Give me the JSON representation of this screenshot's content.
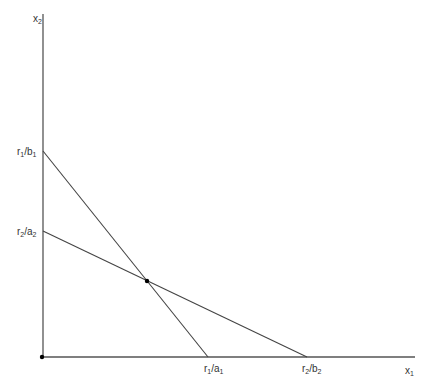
{
  "diagram": {
    "type": "linear-constraints-graph",
    "axes": {
      "x_label": "x",
      "x_label_sub": "1",
      "y_label": "x",
      "y_label_sub": "2"
    },
    "y_intercepts": [
      {
        "num": "r",
        "num_sub": "1",
        "den": "b",
        "den_sub": "1"
      },
      {
        "num": "r",
        "num_sub": "2",
        "den": "a",
        "den_sub": "2"
      }
    ],
    "x_intercepts": [
      {
        "num": "r",
        "num_sub": "1",
        "den": "a",
        "den_sub": "1"
      },
      {
        "num": "r",
        "num_sub": "2",
        "den": "b",
        "den_sub": "2"
      }
    ],
    "lines": [
      {
        "name": "constraint-1",
        "from": "r1/b1",
        "to": "r1/a1"
      },
      {
        "name": "constraint-2",
        "from": "r2/a2",
        "to": "r2/b2"
      }
    ],
    "points": [
      {
        "name": "origin"
      },
      {
        "name": "intersection"
      }
    ],
    "colors": {
      "axis": "#555555",
      "line": "#444444",
      "text": "#333333",
      "point": "#000000"
    }
  }
}
